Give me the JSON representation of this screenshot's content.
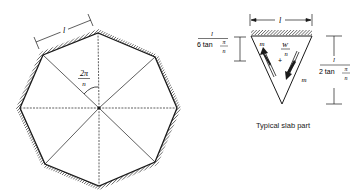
{
  "figure": {
    "octagon": {
      "side_label": "l",
      "angle_label_num": "2π",
      "angle_label_den": "n",
      "vertices": [
        [
          98,
          33
        ],
        [
          155,
          57
        ],
        [
          177,
          108
        ],
        [
          155,
          162
        ],
        [
          99,
          186
        ],
        [
          45,
          164
        ],
        [
          20,
          108
        ],
        [
          43,
          55
        ]
      ],
      "center": [
        99,
        108
      ]
    },
    "slab_part": {
      "width_label": "l",
      "left_dim_num": "l",
      "left_dim_den_prefix": "6 tan",
      "left_dim_den_pi": "π",
      "left_dim_den_n": "n",
      "right_dim_num": "l",
      "right_dim_den_prefix": "2 tan",
      "right_dim_den_pi": "π",
      "right_dim_den_n": "n",
      "moment_label_left": "m",
      "moment_label_right": "m",
      "load_num": "W",
      "load_den": "n",
      "centroid_marker": "+",
      "caption": "Typical slab part"
    },
    "line_color": "#1a1a1a"
  }
}
